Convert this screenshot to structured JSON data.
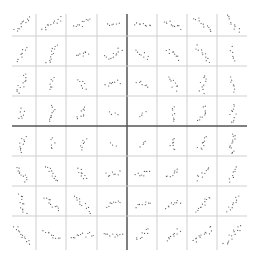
{
  "chart_data": {
    "type": "scatter",
    "title": "",
    "xlabel": "",
    "ylabel": "",
    "layout": "8x8 scatterplot matrix (small multiples), no axis ticks or labels",
    "grid": true,
    "legend": "none",
    "rows": 8,
    "cols": 8,
    "grid_x": [
      6,
      36,
      66,
      97,
      127,
      157,
      187,
      217,
      247
    ],
    "grid_y": [
      6,
      36,
      66,
      96,
      126,
      156,
      186,
      216,
      248
    ],
    "center_line_index": 4,
    "colors": {
      "dot": "#555555",
      "grid": "#cfcfcf",
      "center_line": "#555555",
      "background": "#ffffff"
    },
    "cell_description": "each cell shows ~10 points forming an elongated cloud; angle in degrees (positive = rising to the right), length and width in px",
    "cells": [
      [
        {
          "angle": 40,
          "len": 20,
          "wid": 5,
          "n": 12
        },
        {
          "angle": 30,
          "len": 22,
          "wid": 5,
          "n": 12
        },
        {
          "angle": 25,
          "len": 18,
          "wid": 5,
          "n": 10
        },
        {
          "angle": 0,
          "len": 12,
          "wid": 4,
          "n": 6
        },
        {
          "angle": -10,
          "len": 16,
          "wid": 5,
          "n": 9
        },
        {
          "angle": -25,
          "len": 18,
          "wid": 5,
          "n": 10
        },
        {
          "angle": -40,
          "len": 22,
          "wid": 4,
          "n": 11
        },
        {
          "angle": -55,
          "len": 20,
          "wid": 5,
          "n": 10
        }
      ],
      [
        {
          "angle": 70,
          "len": 16,
          "wid": 5,
          "n": 8
        },
        {
          "angle": 62,
          "len": 20,
          "wid": 5,
          "n": 12
        },
        {
          "angle": 20,
          "len": 12,
          "wid": 5,
          "n": 8
        },
        {
          "angle": 30,
          "len": 18,
          "wid": 6,
          "n": 11
        },
        {
          "angle": -35,
          "len": 14,
          "wid": 5,
          "n": 8
        },
        {
          "angle": -35,
          "len": 16,
          "wid": 5,
          "n": 9
        },
        {
          "angle": -45,
          "len": 20,
          "wid": 5,
          "n": 11
        },
        {
          "angle": -75,
          "len": 14,
          "wid": 4,
          "n": 6
        }
      ],
      [
        {
          "angle": 65,
          "len": 20,
          "wid": 6,
          "n": 12
        },
        {
          "angle": 70,
          "len": 12,
          "wid": 5,
          "n": 7
        },
        {
          "angle": -65,
          "len": 12,
          "wid": 5,
          "n": 7
        },
        {
          "angle": 20,
          "len": 14,
          "wid": 5,
          "n": 8
        },
        {
          "angle": -20,
          "len": 12,
          "wid": 5,
          "n": 7
        },
        {
          "angle": -50,
          "len": 14,
          "wid": 6,
          "n": 9
        },
        {
          "angle": 80,
          "len": 18,
          "wid": 6,
          "n": 10
        },
        {
          "angle": -70,
          "len": 14,
          "wid": 4,
          "n": 7
        }
      ],
      [
        {
          "angle": 75,
          "len": 12,
          "wid": 5,
          "n": 7
        },
        {
          "angle": 80,
          "len": 16,
          "wid": 5,
          "n": 10
        },
        {
          "angle": 55,
          "len": 14,
          "wid": 6,
          "n": 9
        },
        {
          "angle": -30,
          "len": 8,
          "wid": 4,
          "n": 4
        },
        {
          "angle": 60,
          "len": 8,
          "wid": 3,
          "n": 4
        },
        {
          "angle": 80,
          "len": 14,
          "wid": 5,
          "n": 8
        },
        {
          "angle": 70,
          "len": 16,
          "wid": 6,
          "n": 10
        },
        {
          "angle": 75,
          "len": 18,
          "wid": 6,
          "n": 11
        }
      ],
      [
        {
          "angle": 80,
          "len": 16,
          "wid": 6,
          "n": 10
        },
        {
          "angle": 70,
          "len": 10,
          "wid": 5,
          "n": 6
        },
        {
          "angle": 70,
          "len": 12,
          "wid": 5,
          "n": 7
        },
        {
          "angle": -20,
          "len": 6,
          "wid": 3,
          "n": 3
        },
        {
          "angle": 60,
          "len": 8,
          "wid": 3,
          "n": 4
        },
        {
          "angle": 80,
          "len": 12,
          "wid": 6,
          "n": 8
        },
        {
          "angle": 55,
          "len": 14,
          "wid": 6,
          "n": 9
        },
        {
          "angle": 75,
          "len": 20,
          "wid": 6,
          "n": 13
        }
      ],
      [
        {
          "angle": -60,
          "len": 18,
          "wid": 5,
          "n": 11
        },
        {
          "angle": -58,
          "len": 18,
          "wid": 5,
          "n": 11
        },
        {
          "angle": -55,
          "len": 14,
          "wid": 5,
          "n": 9
        },
        {
          "angle": 10,
          "len": 14,
          "wid": 5,
          "n": 8
        },
        {
          "angle": 10,
          "len": 14,
          "wid": 5,
          "n": 9
        },
        {
          "angle": 40,
          "len": 14,
          "wid": 5,
          "n": 8
        },
        {
          "angle": 40,
          "len": 16,
          "wid": 5,
          "n": 9
        },
        {
          "angle": 70,
          "len": 16,
          "wid": 4,
          "n": 8
        }
      ],
      [
        {
          "angle": -75,
          "len": 20,
          "wid": 5,
          "n": 12
        },
        {
          "angle": -45,
          "len": 20,
          "wid": 5,
          "n": 11
        },
        {
          "angle": -40,
          "len": 22,
          "wid": 5,
          "n": 12
        },
        {
          "angle": 15,
          "len": 14,
          "wid": 4,
          "n": 8
        },
        {
          "angle": 15,
          "len": 16,
          "wid": 4,
          "n": 8
        },
        {
          "angle": 20,
          "len": 16,
          "wid": 4,
          "n": 9
        },
        {
          "angle": 45,
          "len": 20,
          "wid": 5,
          "n": 12
        },
        {
          "angle": 50,
          "len": 18,
          "wid": 5,
          "n": 10
        }
      ],
      [
        {
          "angle": -55,
          "len": 22,
          "wid": 5,
          "n": 13
        },
        {
          "angle": -35,
          "len": 18,
          "wid": 5,
          "n": 10
        },
        {
          "angle": 5,
          "len": 22,
          "wid": 5,
          "n": 12
        },
        {
          "angle": 5,
          "len": 18,
          "wid": 5,
          "n": 10
        },
        {
          "angle": 40,
          "len": 16,
          "wid": 5,
          "n": 9
        },
        {
          "angle": 40,
          "len": 16,
          "wid": 5,
          "n": 10
        },
        {
          "angle": 35,
          "len": 24,
          "wid": 6,
          "n": 14
        },
        {
          "angle": 50,
          "len": 24,
          "wid": 6,
          "n": 14
        }
      ]
    ]
  }
}
